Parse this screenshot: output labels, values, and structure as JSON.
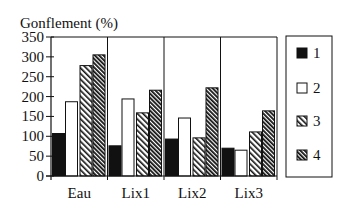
{
  "chart_data": {
    "type": "bar",
    "title": "",
    "ylabel": "Gonflement (%)",
    "xlabel": "",
    "categories": [
      "Eau",
      "Lix1",
      "Lix2",
      "Lix3"
    ],
    "series": [
      {
        "name": "1",
        "fill": "solid-black",
        "values": [
          107,
          76,
          93,
          70
        ]
      },
      {
        "name": "2",
        "fill": "white",
        "values": [
          187,
          194,
          146,
          65
        ]
      },
      {
        "name": "3",
        "fill": "light-diagonal-hatch",
        "values": [
          278,
          159,
          96,
          111
        ]
      },
      {
        "name": "4",
        "fill": "dense-diagonal-hatch",
        "values": [
          305,
          216,
          222,
          164
        ]
      }
    ],
    "ylim": [
      0,
      350
    ],
    "yticks": [
      0,
      50,
      100,
      150,
      200,
      250,
      300,
      350
    ],
    "grid": false,
    "group_separators": true,
    "legend": {
      "position": "right",
      "entries": [
        "1",
        "2",
        "3",
        "4"
      ]
    }
  },
  "colors": {
    "ink": "#111111",
    "background": "#ffffff"
  }
}
